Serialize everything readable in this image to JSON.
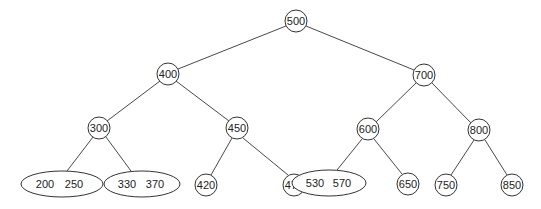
{
  "diagram": {
    "type": "tree",
    "title": "",
    "nodes": [
      {
        "id": "n500",
        "keys": [
          "500"
        ],
        "shape": "circle",
        "x": 296,
        "y": 21
      },
      {
        "id": "n400",
        "keys": [
          "400"
        ],
        "shape": "circle",
        "x": 168,
        "y": 74
      },
      {
        "id": "n700",
        "keys": [
          "700"
        ],
        "shape": "circle",
        "x": 424,
        "y": 75
      },
      {
        "id": "n300",
        "keys": [
          "300"
        ],
        "shape": "circle",
        "x": 99,
        "y": 128
      },
      {
        "id": "n450",
        "keys": [
          "450"
        ],
        "shape": "circle",
        "x": 237,
        "y": 128
      },
      {
        "id": "n600",
        "keys": [
          "600"
        ],
        "shape": "circle",
        "x": 368,
        "y": 129
      },
      {
        "id": "n800",
        "keys": [
          "800"
        ],
        "shape": "circle",
        "x": 479,
        "y": 130
      },
      {
        "id": "n200_250",
        "keys": [
          "200",
          "250"
        ],
        "shape": "ellipse",
        "x": 62,
        "y": 184
      },
      {
        "id": "n330_370",
        "keys": [
          "330",
          "370"
        ],
        "shape": "ellipse",
        "x": 142,
        "y": 184
      },
      {
        "id": "n420",
        "keys": [
          "420"
        ],
        "shape": "circle",
        "x": 206,
        "y": 185
      },
      {
        "id": "n470",
        "keys": [
          "470"
        ],
        "shape": "circle",
        "x": 294,
        "y": 185
      },
      {
        "id": "n530_570",
        "keys": [
          "530",
          "570"
        ],
        "shape": "ellipse",
        "x": 329,
        "y": 183
      },
      {
        "id": "n650",
        "keys": [
          "650"
        ],
        "shape": "circle",
        "x": 408,
        "y": 184
      },
      {
        "id": "n750",
        "keys": [
          "750"
        ],
        "shape": "circle",
        "x": 446,
        "y": 185
      },
      {
        "id": "n850",
        "keys": [
          "850"
        ],
        "shape": "circle",
        "x": 512,
        "y": 185
      }
    ],
    "edges": [
      [
        "n500",
        "n400"
      ],
      [
        "n500",
        "n700"
      ],
      [
        "n400",
        "n300"
      ],
      [
        "n400",
        "n450"
      ],
      [
        "n700",
        "n600"
      ],
      [
        "n700",
        "n800"
      ],
      [
        "n300",
        "n200_250"
      ],
      [
        "n300",
        "n330_370"
      ],
      [
        "n450",
        "n420"
      ],
      [
        "n450",
        "n470"
      ],
      [
        "n600",
        "n530_570"
      ],
      [
        "n600",
        "n650"
      ],
      [
        "n800",
        "n750"
      ],
      [
        "n800",
        "n850"
      ]
    ],
    "labels": {
      "n500": "500",
      "n400": "400",
      "n700": "700",
      "n300": "300",
      "n450": "450",
      "n600": "600",
      "n800": "800",
      "n200_250": {
        "k0": "200",
        "k1": "250"
      },
      "n330_370": {
        "k0": "330",
        "k1": "370"
      },
      "n420": "420",
      "n470": "470",
      "n530_570": {
        "k0": "530",
        "k1": "570"
      },
      "n650": "650",
      "n750": "750",
      "n850": "850"
    },
    "colors": {
      "stroke": "#333333",
      "text": "#222222",
      "background": "#ffffff"
    }
  }
}
